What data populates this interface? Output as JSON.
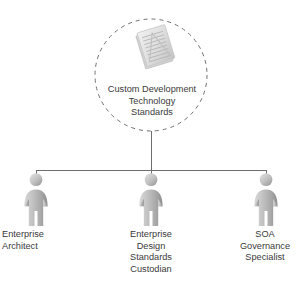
{
  "diagram": {
    "type": "org-chart",
    "title_node": {
      "icon": "document-stack-icon",
      "label": "Custom Development\nTechnology\nStandards",
      "shape": "dashed-circle"
    },
    "roles": [
      {
        "icon": "person-icon",
        "label": "Enterprise\nArchitect"
      },
      {
        "icon": "person-icon",
        "label": "Enterprise\nDesign\nStandards\nCustodian"
      },
      {
        "icon": "person-icon",
        "label": "SOA\nGovernance\nSpecialist"
      }
    ],
    "colors": {
      "text": "#3a3a3a",
      "connector": "#6e6e6e",
      "circle_dash": "#707070",
      "figure_light": "#d2d2d2",
      "figure_mid": "#b4b4b4",
      "figure_dark": "#8f8f8f",
      "document_light": "#e8e8e8",
      "document_dark": "#c9c9c9",
      "background": "#ffffff"
    }
  }
}
